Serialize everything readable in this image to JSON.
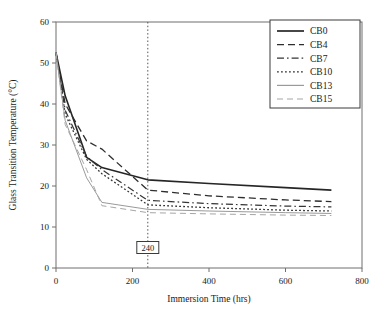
{
  "chart_data": {
    "type": "line",
    "title": "",
    "xlabel": "Immersion Time (hrs)",
    "ylabel": "Glass Transition Temperature (°C)",
    "xlim": [
      0,
      800
    ],
    "ylim": [
      0,
      60
    ],
    "xticks": [
      0,
      200,
      400,
      600,
      800
    ],
    "yticks": [
      0,
      10,
      20,
      30,
      40,
      50,
      60
    ],
    "xtick_labels": [
      "0",
      "200",
      "400",
      "600",
      "800"
    ],
    "ytick_labels": [
      "0",
      "10",
      "20",
      "30",
      "40",
      "50",
      "60"
    ],
    "grid": false,
    "legend_position": "top-right",
    "annotations": [
      {
        "name": "immersion-time-marker",
        "label": "240",
        "x": 240,
        "style": "dotted vertical line with boxed label",
        "label_y": 5.0
      }
    ],
    "series": [
      {
        "name": "CB0",
        "style": "solid",
        "color": "#262626",
        "width": 1.6,
        "x": [
          0,
          24,
          80,
          120,
          240,
          400,
          600,
          720
        ],
        "values": [
          52.5,
          42.0,
          27.0,
          24.5,
          21.5,
          20.6,
          19.6,
          19.0
        ]
      },
      {
        "name": "CB4",
        "style": "dashed",
        "color": "#2e2e2e",
        "width": 1.3,
        "x": [
          0,
          24,
          80,
          120,
          240,
          400,
          600,
          720
        ],
        "values": [
          52.5,
          40.0,
          31.0,
          29.0,
          19.0,
          17.6,
          16.6,
          16.2
        ]
      },
      {
        "name": "CB7",
        "style": "dashdot",
        "color": "#353535",
        "width": 1.2,
        "x": [
          0,
          24,
          80,
          120,
          240,
          400,
          600,
          720
        ],
        "values": [
          52.5,
          38.5,
          27.2,
          24.0,
          16.5,
          15.7,
          15.1,
          14.9
        ]
      },
      {
        "name": "CB10",
        "style": "dotted",
        "color": "#333333",
        "width": 1.3,
        "x": [
          0,
          24,
          80,
          120,
          240,
          400,
          600,
          720
        ],
        "values": [
          52.5,
          37.5,
          26.5,
          23.0,
          15.4,
          14.7,
          14.1,
          13.9
        ]
      },
      {
        "name": "CB13",
        "style": "solid",
        "color": "#9a9a9a",
        "width": 1.0,
        "x": [
          0,
          24,
          80,
          120,
          240,
          400,
          600,
          720
        ],
        "values": [
          52.5,
          36.0,
          22.0,
          16.0,
          14.3,
          13.9,
          13.5,
          13.3
        ]
      },
      {
        "name": "CB15",
        "style": "dashed-light",
        "color": "#a6a6a6",
        "width": 1.0,
        "x": [
          0,
          24,
          80,
          120,
          240,
          400,
          600,
          720
        ],
        "values": [
          52.5,
          35.0,
          24.0,
          15.2,
          13.5,
          13.2,
          12.9,
          12.8
        ]
      }
    ],
    "legend_entries": [
      {
        "label": "CB0",
        "style": "solid",
        "color": "#262626"
      },
      {
        "label": "CB4",
        "style": "dashed",
        "color": "#2e2e2e"
      },
      {
        "label": "CB7",
        "style": "dashdot",
        "color": "#353535"
      },
      {
        "label": "CB10",
        "style": "dotted",
        "color": "#333333"
      },
      {
        "label": "CB13",
        "style": "solid",
        "color": "#9a9a9a"
      },
      {
        "label": "CB15",
        "style": "dashed-light",
        "color": "#a6a6a6"
      }
    ]
  }
}
